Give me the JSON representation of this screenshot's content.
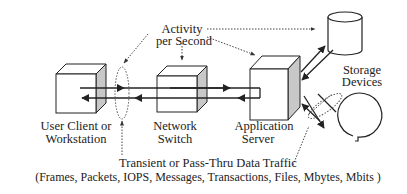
{
  "diagram": {
    "labels": {
      "activity_line1": "Activity",
      "activity_line2": "per Second",
      "storage_line1": "Storage",
      "storage_line2": "Devices",
      "client_line1": "User Client or",
      "client_line2": "Workstation",
      "switch_line1": "Network",
      "switch_line2": "Switch",
      "server_line1": "Application",
      "server_line2": "Server",
      "traffic_line1": "Transient or Pass-Thru Data Traffic",
      "traffic_line2": "(Frames, Packets, IOPS, Messages, Transactions, Files, Mbytes, Mbits )"
    },
    "nodes": [
      {
        "id": "user-client",
        "shape": "cube"
      },
      {
        "id": "network-switch",
        "shape": "cube"
      },
      {
        "id": "application-server",
        "shape": "cube"
      },
      {
        "id": "storage-disk",
        "shape": "cylinder"
      },
      {
        "id": "storage-tape",
        "shape": "tape-reel"
      }
    ],
    "colors": {
      "stroke": "#222222",
      "cube_side": "#c8c8c8",
      "background": "#ffffff"
    }
  }
}
